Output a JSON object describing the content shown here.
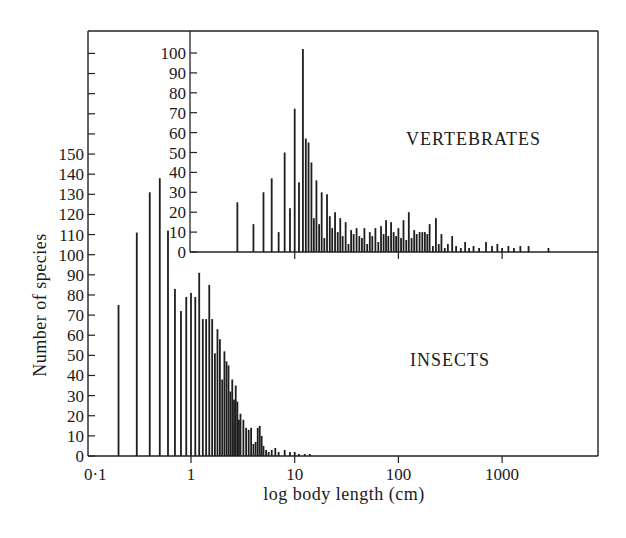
{
  "chart_data": [
    {
      "panel": "insects",
      "type": "bar",
      "title": "",
      "label": "INSECTS",
      "xlabel": "log body length (cm)",
      "ylabel": "Number of species",
      "x_scale": "log",
      "x_ticks": [
        "0·1",
        "1",
        "10",
        "100",
        "1000"
      ],
      "xlim": [
        0.1,
        9000
      ],
      "y_ticks": [
        0,
        10,
        20,
        30,
        40,
        50,
        60,
        70,
        80,
        90,
        100,
        110,
        120,
        130,
        140,
        150
      ],
      "ylim": [
        0,
        150
      ],
      "grid": false,
      "x": [
        0.2,
        0.3,
        0.4,
        0.5,
        0.6,
        0.7,
        0.8,
        0.9,
        1.0,
        1.1,
        1.2,
        1.3,
        1.4,
        1.5,
        1.6,
        1.7,
        1.8,
        1.9,
        2.0,
        2.1,
        2.2,
        2.3,
        2.4,
        2.5,
        2.6,
        2.7,
        2.8,
        2.9,
        3.0,
        3.2,
        3.4,
        3.6,
        3.8,
        4.0,
        4.2,
        4.4,
        4.6,
        4.8,
        5.0,
        5.3,
        5.6,
        6.0,
        6.5,
        7.0,
        8.0,
        9.0,
        10.0,
        11.0,
        12.5,
        14.0
      ],
      "values": [
        75,
        111,
        131,
        138,
        112,
        83,
        72,
        79,
        81,
        79,
        91,
        68,
        68,
        85,
        68,
        51,
        63,
        58,
        38,
        52,
        47,
        45,
        32,
        38,
        28,
        35,
        27,
        18,
        21,
        18,
        14,
        13,
        14,
        6,
        7,
        14,
        15,
        10,
        5,
        3,
        2,
        3,
        4,
        2,
        3,
        2,
        2,
        1,
        1,
        1
      ]
    },
    {
      "panel": "vertebrates",
      "type": "bar",
      "title": "",
      "label": "VERTEBRATES",
      "xlabel": "log body length (cm)",
      "ylabel": "Number of species",
      "x_scale": "log",
      "x_ticks": [
        "1",
        "10",
        "100",
        "1000"
      ],
      "y_ticks": [
        0,
        10,
        20,
        30,
        40,
        50,
        60,
        70,
        80,
        90,
        100
      ],
      "ylim": [
        0,
        100
      ],
      "grid": false,
      "x": [
        2.8,
        4.0,
        5.0,
        6.0,
        7.0,
        8.0,
        9.0,
        10.0,
        11.0,
        12.0,
        12.8,
        13.6,
        14.5,
        15.3,
        16.2,
        17.2,
        18.2,
        19.3,
        20.5,
        21.8,
        23.0,
        24.5,
        26.0,
        27.5,
        29.0,
        31.0,
        33.0,
        35.0,
        37.0,
        39.5,
        42.0,
        44.5,
        47.0,
        50.0,
        53.0,
        56.0,
        60.0,
        64.0,
        68.0,
        72.0,
        76.0,
        80.0,
        85.0,
        90.0,
        95.0,
        100.0,
        106.0,
        112.0,
        119.0,
        126.0,
        134.0,
        142.0,
        150.0,
        160.0,
        170.0,
        180.0,
        190.0,
        200.0,
        215.0,
        230.0,
        245.0,
        260.0,
        280.0,
        300.0,
        330.0,
        360.0,
        400.0,
        440.0,
        480.0,
        530.0,
        600.0,
        700.0,
        800.0,
        900.0,
        1000.0,
        1150.0,
        1300.0,
        1500.0,
        1800.0,
        2800.0
      ],
      "values": [
        25,
        14,
        30,
        37,
        10,
        50,
        22,
        72,
        35,
        102,
        57,
        55,
        45,
        17,
        36,
        14,
        30,
        7,
        29,
        18,
        12,
        20,
        10,
        17,
        8,
        15,
        4,
        11,
        9,
        12,
        8,
        7,
        12,
        4,
        10,
        8,
        12,
        5,
        13,
        9,
        16,
        8,
        15,
        10,
        8,
        12,
        7,
        16,
        6,
        20,
        7,
        11,
        9,
        10,
        10,
        10,
        9,
        14,
        3,
        17,
        4,
        9,
        2,
        4,
        8,
        3,
        2,
        5,
        2,
        3,
        2,
        5,
        3,
        4,
        2,
        3,
        2,
        3,
        3,
        2
      ]
    }
  ],
  "labels": {
    "ylabel": "Number of species",
    "xlabel": "log body length (cm)",
    "insects": "INSECTS",
    "vertebrates": "VERTEBRATES"
  }
}
